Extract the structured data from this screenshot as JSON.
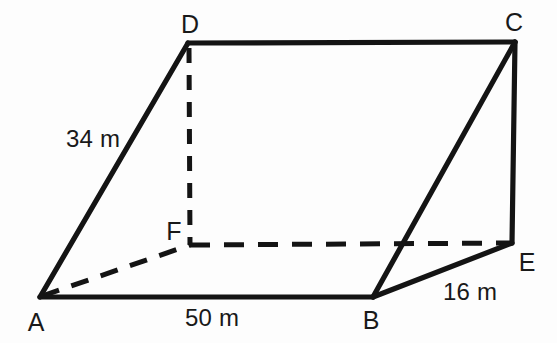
{
  "figure": {
    "background_color": "#fdfdfd",
    "stroke_color": "#141414"
  },
  "vertices": [
    {
      "name": "A",
      "label": "A",
      "x": 40,
      "y": 297,
      "label_x": 36,
      "label_y": 322
    },
    {
      "name": "B",
      "label": "B",
      "x": 373,
      "y": 297,
      "label_x": 371,
      "label_y": 320
    },
    {
      "name": "C",
      "label": "C",
      "x": 515,
      "y": 42,
      "label_x": 514,
      "label_y": 22
    },
    {
      "name": "D",
      "label": "D",
      "x": 188,
      "y": 43,
      "label_x": 190,
      "label_y": 24
    },
    {
      "name": "E",
      "label": "E",
      "x": 512,
      "y": 243,
      "label_x": 527,
      "label_y": 262
    },
    {
      "name": "F",
      "label": "F",
      "x": 190,
      "y": 245,
      "label_x": 174,
      "label_y": 231
    }
  ],
  "vertex_labels": {
    "A": "A",
    "B": "B",
    "C": "C",
    "D": "D",
    "E": "E",
    "F": "F"
  },
  "edges": {
    "solid": [
      {
        "from": "A",
        "to": "B",
        "path": "M 40 297 L 373 297"
      },
      {
        "from": "A",
        "to": "D",
        "path": "M 40 297 L 188 43"
      },
      {
        "from": "D",
        "to": "C",
        "path": "M 188 43 L 515 42"
      },
      {
        "from": "B",
        "to": "C",
        "path": "M 373 297 L 515 42"
      },
      {
        "from": "B",
        "to": "E",
        "path": "M 373 297 L 512 243"
      },
      {
        "from": "C",
        "to": "E",
        "path": "M 515 42 L 512 243"
      }
    ],
    "dashed": [
      {
        "from": "D",
        "to": "F",
        "path": "M 189 48 L 190 245"
      },
      {
        "from": "F",
        "to": "E",
        "path": "M 190 245 L 512 243"
      },
      {
        "from": "A",
        "to": "F",
        "path": "M 42 296 L 190 245"
      }
    ]
  },
  "measurements": [
    {
      "name": "side-ad",
      "edge": "AD",
      "text": "34 m",
      "x": 93,
      "y": 139
    },
    {
      "name": "side-ab",
      "edge": "AB",
      "text": "50 m",
      "x": 212,
      "y": 318
    },
    {
      "name": "side-be",
      "edge": "BE",
      "text": "16 m",
      "x": 470,
      "y": 292
    }
  ]
}
